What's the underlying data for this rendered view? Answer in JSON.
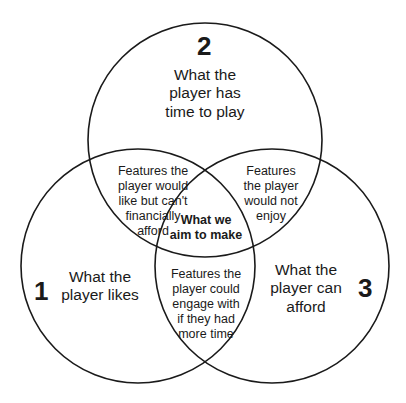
{
  "diagram": {
    "type": "venn-3",
    "circles": [
      {
        "id": "1",
        "number": "1",
        "label": "What the\nplayer likes"
      },
      {
        "id": "2",
        "number": "2",
        "label": "What the\nplayer has\ntime to play"
      },
      {
        "id": "3",
        "number": "3",
        "label": "What the\nplayer can\nafford"
      }
    ],
    "intersections": {
      "i1_2": "Features the\nplayer would\nlike but can't\nfinancially\nafford",
      "i2_3": "Features\nthe player\nwould not\nenjoy",
      "i1_3": "Features the\nplayer could\nengage with\nif they had\nmore time",
      "i1_2_3": "What we\naim to make"
    },
    "stroke_color": "#1a1a1a",
    "background": "#ffffff"
  }
}
